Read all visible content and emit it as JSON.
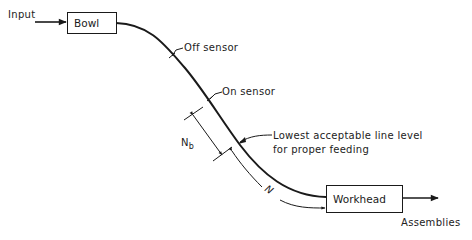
{
  "diagram": {
    "type": "feeder-line-schematic",
    "input_label": "Input",
    "bowl_label": "Bowl",
    "off_sensor_label": "Off sensor",
    "on_sensor_label": "On sensor",
    "lowest_level_label_line1": "Lowest acceptable line level",
    "lowest_level_label_line2": "for proper feeding",
    "nb_label_main": "N",
    "nb_label_sub": "b",
    "n_label": "N",
    "workhead_label": "Workhead",
    "output_label": "Assemblies",
    "colors": {
      "line": "#1a1a1a",
      "background": "#ffffff"
    }
  }
}
